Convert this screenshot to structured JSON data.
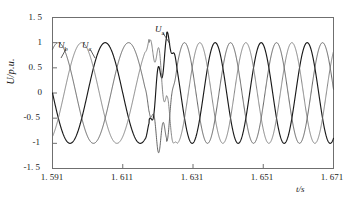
{
  "chart_data": {
    "type": "line",
    "title": "",
    "xlabel": "t/s",
    "ylabel": "U/p.u.",
    "xlim": [
      1.591,
      1.671
    ],
    "ylim": [
      -1.5,
      1.5
    ],
    "grid": false,
    "legend_position": "inline-annotations",
    "xticks": [
      "1. 591",
      "1. 611",
      "1. 631",
      "1. 651",
      "1. 671"
    ],
    "xtick_values": [
      1.591,
      1.611,
      1.631,
      1.651,
      1.671
    ],
    "yticks": [
      "1. 5",
      "1",
      "0. 5",
      "0",
      "-0. 5",
      "-1",
      "-1. 5"
    ],
    "ytick_values": [
      1.5,
      1.0,
      0.5,
      0.0,
      -0.5,
      -1.0,
      -1.5
    ],
    "annotations": [
      {
        "text": "Ub",
        "base": "U",
        "sub": "b",
        "x": 1.5955,
        "y": 0.74
      },
      {
        "text": "Uc",
        "base": "U",
        "sub": "c",
        "x": 1.6022,
        "y": 0.74
      },
      {
        "text": "Ua",
        "base": "U",
        "sub": "a",
        "x": 1.627,
        "y": 1.18
      }
    ],
    "event": {
      "description": "fault transient with voltage notches",
      "t_start": 1.6185,
      "t_end": 1.6235,
      "pre_fault_period_s": 0.02,
      "post_fault_period_s": 0.0131
    },
    "series": [
      {
        "name": "Ua",
        "color": "#1a1a1a",
        "linewidth": 1.15,
        "amplitude": 1.0,
        "phase_deg": 180,
        "description": "phase A voltage, bold trace"
      },
      {
        "name": "Ub",
        "color": "#4a4a4a",
        "linewidth": 0.85,
        "amplitude": 1.0,
        "phase_deg": 60,
        "description": "phase B voltage"
      },
      {
        "name": "Uc",
        "color": "#707070",
        "linewidth": 0.85,
        "amplitude": 1.0,
        "phase_deg": -60,
        "description": "phase C voltage"
      }
    ]
  },
  "frame": {
    "border_color": "#6f6f6f",
    "background": "#ffffff"
  }
}
